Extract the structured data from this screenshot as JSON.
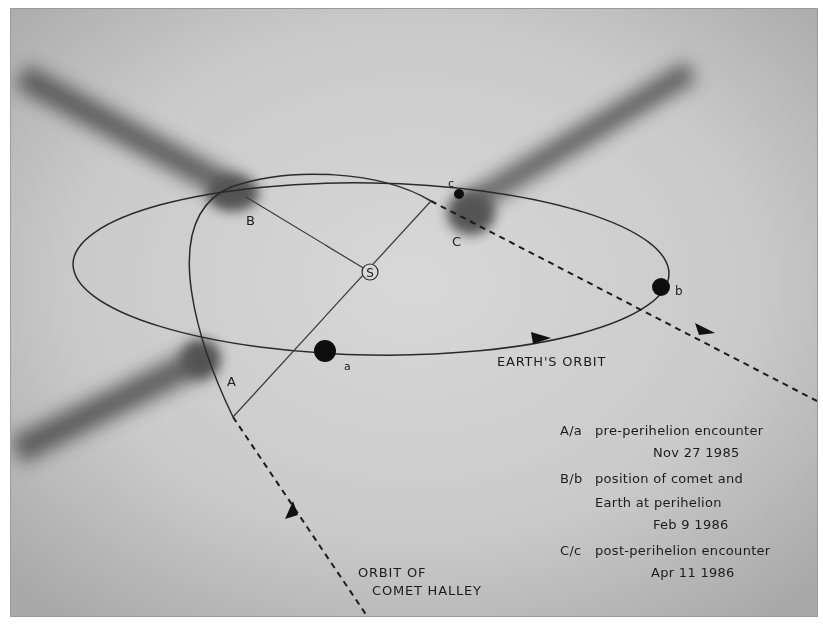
{
  "diagram": {
    "sun_label": "S",
    "comet_positions": [
      {
        "label": "A",
        "x": 232,
        "y": 380
      },
      {
        "label": "B",
        "x": 250,
        "y": 218
      },
      {
        "label": "C",
        "x": 458,
        "y": 240
      }
    ],
    "earth_positions": [
      {
        "label": "a",
        "x": 343,
        "y": 366
      },
      {
        "label": "b",
        "x": 680,
        "y": 289
      },
      {
        "label": "c",
        "x": 448,
        "y": 181
      }
    ],
    "orbit_labels": {
      "earth_orbit": "EARTH'S ORBIT",
      "comet_orbit_line1": "ORBIT OF",
      "comet_orbit_line2": "COMET HALLEY"
    },
    "legend": [
      {
        "key": "A/a",
        "text": "pre-perihelion encounter",
        "date": "Nov 27 1985"
      },
      {
        "key": "B/b",
        "text": "position of comet and",
        "text2": "Earth at perihelion",
        "date": "Feb 9 1986"
      },
      {
        "key": "C/c",
        "text": "post-perihelion encounter",
        "date": "Apr 11 1986"
      }
    ],
    "colors": {
      "background": "#c9c9c9",
      "ink": "#1c1c1c",
      "tail": "#555555"
    }
  }
}
